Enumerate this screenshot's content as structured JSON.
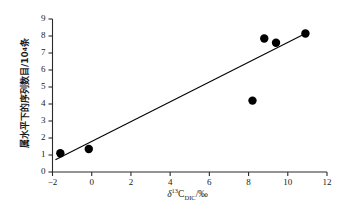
{
  "chart_data": {
    "type": "scatter",
    "title": "",
    "xlabel": "δ¹³C_DIC/‰",
    "xlabel_parts": {
      "symbol": "δ",
      "superscript": "13",
      "element": "C",
      "subscript": "DIC",
      "unit": "/‰"
    },
    "ylabel": "属水平下的序列数目/10⁴条",
    "ylabel_parts": {
      "text": "属水平下的序列数目/10",
      "superscript": "4",
      "unit": "条"
    },
    "xlim": [
      -2,
      12
    ],
    "ylim": [
      0,
      9
    ],
    "xticks": [
      "-2",
      "0",
      "2",
      "4",
      "6",
      "8",
      "10",
      "12"
    ],
    "xtick_values": [
      -2,
      0,
      2,
      4,
      6,
      8,
      10,
      12
    ],
    "yticks": [
      "0",
      "1",
      "2",
      "3",
      "4",
      "5",
      "6",
      "7",
      "8",
      "9"
    ],
    "ytick_values": [
      0,
      1,
      2,
      3,
      4,
      5,
      6,
      7,
      8,
      9
    ],
    "grid": false,
    "legend": null,
    "marker": "filled-circle",
    "marker_color": "#000000",
    "line_color": "#000000",
    "points": [
      {
        "x": -1.6,
        "y": 1.1
      },
      {
        "x": -0.15,
        "y": 1.35
      },
      {
        "x": 8.2,
        "y": 4.2
      },
      {
        "x": 8.8,
        "y": 7.85
      },
      {
        "x": 9.4,
        "y": 7.6
      },
      {
        "x": 10.9,
        "y": 8.15
      }
    ],
    "series": [
      {
        "name": "samples",
        "x": [
          -1.6,
          -0.15,
          8.2,
          8.8,
          9.4,
          10.9
        ],
        "values": [
          1.1,
          1.35,
          4.2,
          7.85,
          7.6,
          8.15
        ]
      }
    ],
    "trendline": {
      "type": "linear-fit",
      "x_start": -1.85,
      "y_start": 0.72,
      "x_end": 10.9,
      "y_end": 8.15
    },
    "axes_style": {
      "spines": [
        "left",
        "bottom"
      ],
      "tick_direction": "out",
      "axis_color": "#1a1a1a"
    }
  }
}
